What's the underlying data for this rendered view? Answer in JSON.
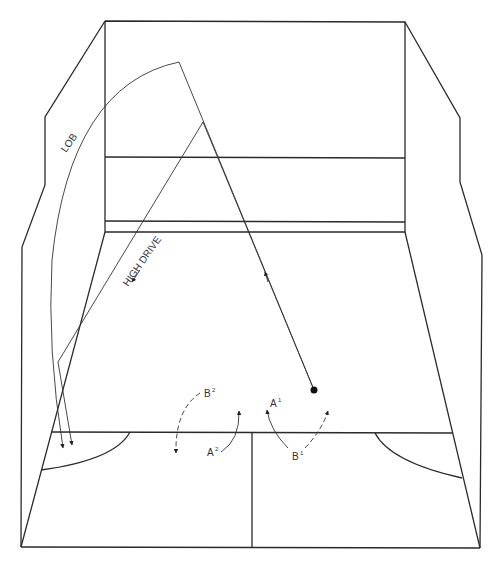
{
  "diagram": {
    "labels": {
      "lob": "LOB",
      "high_drive": "HIGH DRIVE",
      "a1": "A",
      "a1_sup": "1",
      "b1": "B",
      "b1_sup": "1",
      "a2": "A",
      "a2_sup": "2",
      "b2": "B",
      "b2_sup": "2"
    },
    "colors": {
      "line": "#2a2a2a",
      "background": "#ffffff"
    }
  }
}
